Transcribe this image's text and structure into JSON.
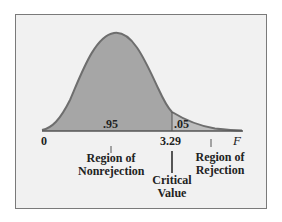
{
  "diagram": {
    "type": "F-distribution critical region",
    "axis": {
      "origin_label": "0",
      "end_label": "F"
    },
    "areas": {
      "nonrejection": ".95",
      "rejection": ".05"
    },
    "critical_value": "3.29",
    "labels": {
      "nonrejection_line1": "Region of",
      "nonrejection_line2": "Nonrejection",
      "rejection_line1": "Region of",
      "rejection_line2": "Rejection",
      "critical_line1": "Critical",
      "critical_line2": "Value"
    },
    "colors": {
      "fill": "#a6a6a6",
      "curve": "#6e6e6e",
      "background": "#f1f1f1"
    }
  }
}
